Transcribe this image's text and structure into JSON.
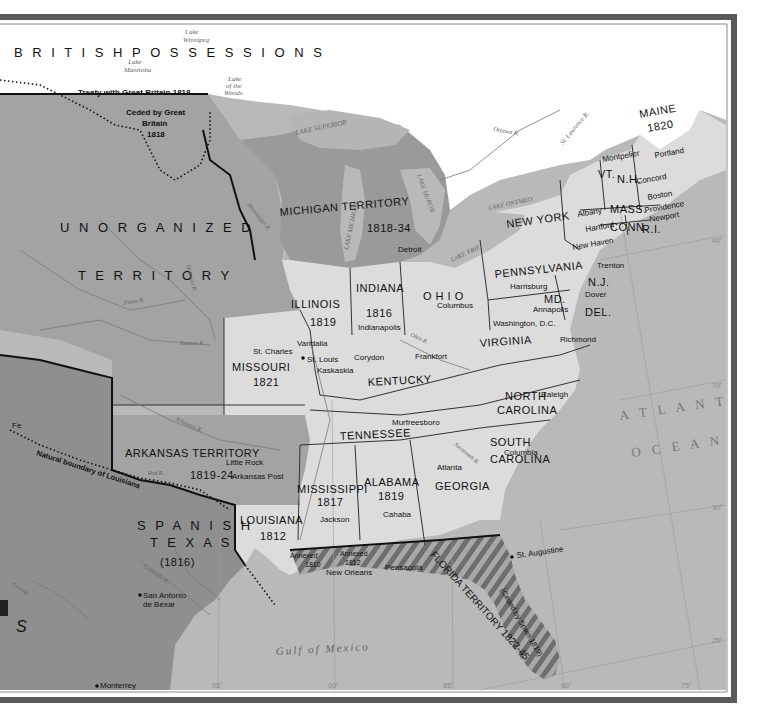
{
  "map": {
    "regions": {
      "british_possessions": "B R I T I S H     P O S S E S S I O N S",
      "treaty_line": "Treaty with Great Britain 1818",
      "ceded": [
        "Ceded by Great",
        "Britain",
        "1818"
      ],
      "unorganized": [
        "U N O R G A N I Z E D",
        "T E R R I T O R Y"
      ],
      "michigan": [
        "MICHIGAN  TERRITORY",
        "1818-34"
      ],
      "arkansas": [
        "ARKANSAS  TERRITORY",
        "1819-24"
      ],
      "spanish_texas": [
        "S P A N I S H",
        "T E X A S",
        "(1816)"
      ],
      "natural_boundary": "Natural boundary of Louisiana",
      "florida": [
        "FLORIDA TERRITORY 1822-45",
        "(Ceded by Spain 1819)"
      ],
      "annexed_1810": [
        "Annexed",
        "1810"
      ],
      "annexed_1812": [
        "Annexed",
        "1812"
      ],
      "partial_left_label": "S",
      "partial_santa_fe": "Fe"
    },
    "states": {
      "maine": [
        "MAINE",
        "1820"
      ],
      "vt": "VT.",
      "nh": "N.H.",
      "mass": "MASS.",
      "conn": "CONN.",
      "ri": "R.I.",
      "new_york": "NEW  YORK",
      "pennsylvania": "PENNSYLVANIA",
      "nj": "N.J.",
      "md": "MD.",
      "del": "DEL.",
      "ohio": "O H I O",
      "indiana": [
        "INDIANA",
        "1816"
      ],
      "illinois": [
        "ILLINOIS",
        "1819"
      ],
      "missouri": [
        "MISSOURI",
        "1821"
      ],
      "virginia": "VIRGINIA",
      "kentucky": "KENTUCKY",
      "tennessee": "TENNESSEE",
      "north_carolina": [
        "NORTH",
        "CAROLINA"
      ],
      "south_carolina": [
        "SOUTH",
        "CAROLINA"
      ],
      "georgia": "GEORGIA",
      "alabama": [
        "ALABAMA",
        "1819"
      ],
      "mississippi": [
        "MISSISSIPPI",
        "1817"
      ],
      "louisiana": [
        "LOUISIANA",
        "1812"
      ]
    },
    "cities": [
      {
        "name": "Montpelier"
      },
      {
        "name": "Portland"
      },
      {
        "name": "Concord"
      },
      {
        "name": "Boston"
      },
      {
        "name": "Albany"
      },
      {
        "name": "Providence"
      },
      {
        "name": "Newport"
      },
      {
        "name": "Hartford"
      },
      {
        "name": "New Haven"
      },
      {
        "name": "Trenton"
      },
      {
        "name": "Harrisburg"
      },
      {
        "name": "Dover"
      },
      {
        "name": "Annapolis"
      },
      {
        "name": "Washington, D.C."
      },
      {
        "name": "Richmond"
      },
      {
        "name": "Detroit"
      },
      {
        "name": "Columbus"
      },
      {
        "name": "Indianapolis"
      },
      {
        "name": "Frankfort"
      },
      {
        "name": "Vandalia"
      },
      {
        "name": "St. Charles"
      },
      {
        "name": "St. Louis"
      },
      {
        "name": "Kaskaskia"
      },
      {
        "name": "Corydon"
      },
      {
        "name": "Murfreesboro"
      },
      {
        "name": "Raleigh"
      },
      {
        "name": "Columbia"
      },
      {
        "name": "Atlanta"
      },
      {
        "name": "Little Rock"
      },
      {
        "name": "Arkansas Post"
      },
      {
        "name": "Jackson"
      },
      {
        "name": "Cahaba"
      },
      {
        "name": "New Orleans"
      },
      {
        "name": "Pensacola"
      },
      {
        "name": "St. Augustine"
      },
      {
        "name": "San Antonio"
      },
      {
        "name": "de Béxar"
      },
      {
        "name": "Monterrey"
      }
    ],
    "water": {
      "lake_winnipeg": [
        "Lake",
        "Winnipeg"
      ],
      "lake_manitoba": [
        "Lake",
        "Manitoba"
      ],
      "lake_of_the_woods": [
        "Lake",
        "of the",
        "Woods"
      ],
      "lake_superior": "LAKE SUPERIOR",
      "lake_michigan": "LAKE MICHIGAN",
      "lake_huron": "LAKE HURON",
      "lake_erie": "LAKE ERIE",
      "lake_ontario": "LAKE ONTARIO",
      "atlantic": [
        "A T L A N T I C",
        "O C E A N"
      ],
      "gulf": "Gulf  of  Mexico",
      "rivers": {
        "ottawa": "Ottawa R.",
        "st_lawrence": "St. Lawrence R.",
        "mississippi": "Mississippi R.",
        "missouri": "Missouri R.",
        "platte": "Platte R.",
        "kansas": "Kansas R.",
        "ohio": "Ohio R.",
        "arkansas": "Arkansas R.",
        "red": "Red R.",
        "savannah": "Savannah R.",
        "wabash": "Wabash R.",
        "illinois": "Illinois R.",
        "pearl": "Pearl R.",
        "brazos": "Brazos R.",
        "colorado": "Colorado R.",
        "trinity": "Trinity R.",
        "grande": "Grande",
        "pecos": "Pecos R."
      }
    },
    "graticule": {
      "longitudes": [
        "95°",
        "90°",
        "85°",
        "80°",
        "75°"
      ],
      "latitudes": [
        "40°",
        "35°",
        "30°",
        "25°"
      ],
      "extra_lat_label": "70°"
    },
    "colors": {
      "territory_dark": "#8f8f8f",
      "territory_mid": "#a3a3a3",
      "state_light": "#dcdcdc",
      "state_lighter": "#e8e8e8",
      "water": "#b9b9b9",
      "british": "#ffffff",
      "frame": "#5a5a5a"
    }
  }
}
